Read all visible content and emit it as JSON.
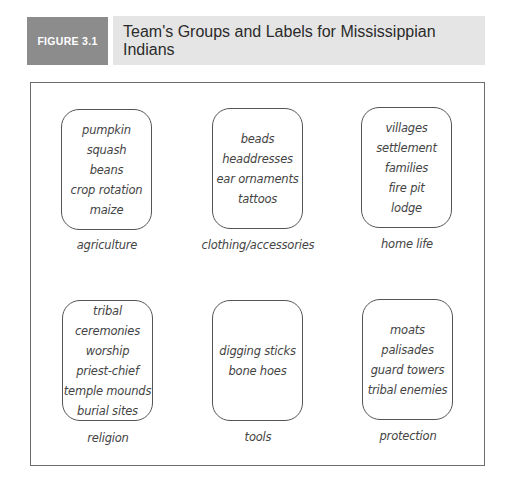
{
  "figure": {
    "label": "FIGURE 3.1",
    "title": "Team's Groups and Labels for Mississippian Indians"
  },
  "colors": {
    "label_bg": "#8c8c8c",
    "title_bg": "#e5e5e5",
    "frame_border": "#6d6d6d"
  },
  "groups": [
    {
      "label": "agriculture",
      "items": [
        "pumpkin",
        "squash",
        "beans",
        "crop rotation",
        "maize"
      ]
    },
    {
      "label": "clothing/accessories",
      "items": [
        "beads",
        "headdresses",
        "ear ornaments",
        "tattoos"
      ]
    },
    {
      "label": "home life",
      "items": [
        "villages",
        "settlement",
        "families",
        "fire pit",
        "lodge"
      ]
    },
    {
      "label": "religion",
      "items": [
        "tribal",
        "ceremonies",
        "worship",
        "priest-chief",
        "temple mounds",
        "burial sites"
      ]
    },
    {
      "label": "tools",
      "items": [
        "digging sticks",
        "bone hoes"
      ]
    },
    {
      "label": "protection",
      "items": [
        "moats",
        "palisades",
        "guard towers",
        "tribal enemies"
      ]
    }
  ]
}
